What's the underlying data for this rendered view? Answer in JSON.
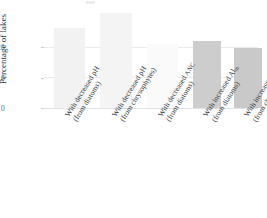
{
  "chart_data": {
    "type": "bar",
    "title": "",
    "xlabel": "",
    "ylabel": "Percentage of lakes",
    "ylim": [
      0,
      32
    ],
    "yticks": [
      0,
      10,
      20
    ],
    "ytick_labels": [
      "0",
      "10",
      "20"
    ],
    "grid": true,
    "legend": "none",
    "categories": [
      "With decreased pH (from diatoms)",
      "With decreased pH (from chrysophytes)",
      "With decreased ANC (from diatoms)",
      "With increased Alm (from diatoms)",
      "With increased Alm (from chrysophytes)"
    ],
    "values": [
      26,
      31,
      21,
      22,
      19.5
    ],
    "bar_colors": [
      "#f2f2f2",
      "#f4f4f4",
      "#fafafa",
      "#cdcdcd",
      "#c9c9c9"
    ]
  },
  "axes": {
    "y_title": "Percentage of lakes",
    "y_ticks": [
      {
        "label": "20",
        "value": 20
      },
      {
        "label": "10",
        "value": 10
      },
      {
        "label": "0",
        "value": 0
      }
    ]
  },
  "bars": [
    {
      "name": "bar-decreased-ph-diatoms",
      "line1": "With decreased pH",
      "line2": "(from diatoms)",
      "value": 26,
      "color": "#f2f2f2"
    },
    {
      "name": "bar-decreased-ph-chrysophytes",
      "line1": "With decreased pH",
      "line2": "(from chrysophytes)",
      "value": 31,
      "color": "#f4f4f4"
    },
    {
      "name": "bar-decreased-anc-diatoms",
      "line1": "With decreased ANC",
      "line2": "(from diatoms)",
      "value": 21,
      "color": "#fafafa"
    },
    {
      "name": "bar-increased-alm-diatoms",
      "line1": "With increased Alm",
      "line2": "(from diatoms)",
      "value": 22,
      "color": "#cdcdcd"
    },
    {
      "name": "bar-increased-alm-chrysophytes",
      "line1": "With increased Alm",
      "line2": "(from chrysophytes)",
      "value": 19.5,
      "color": "#c9c9c9"
    }
  ]
}
